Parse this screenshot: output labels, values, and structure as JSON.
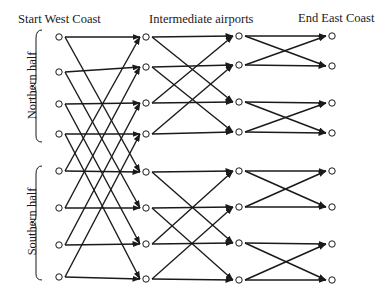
{
  "headers": {
    "start": "Start West Coast",
    "middle": "Intermediate airports",
    "end": "End East Coast"
  },
  "side_labels": {
    "north": "Northern half",
    "south": "Southern half"
  },
  "diagram": {
    "type": "butterfly network",
    "columns": [
      {
        "name": "West Coast",
        "x": 59,
        "ys": [
          37,
          72,
          104,
          134,
          171,
          208,
          245,
          277
        ]
      },
      {
        "name": "Intermediate 1",
        "x": 146,
        "ys": [
          37,
          67,
          103,
          134,
          172,
          208,
          244,
          279
        ]
      },
      {
        "name": "Intermediate 2",
        "x": 239,
        "ys": [
          36,
          65,
          102,
          132,
          171,
          207,
          243,
          280
        ]
      },
      {
        "name": "East Coast",
        "x": 332,
        "ys": [
          36,
          66,
          103,
          133,
          171,
          207,
          244,
          280
        ]
      }
    ],
    "stage_strides": [
      4,
      2,
      1
    ],
    "node_count_per_column": 8,
    "stroke_color": "#1a1a1a"
  }
}
